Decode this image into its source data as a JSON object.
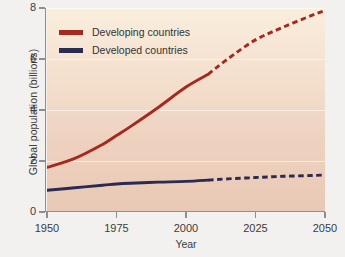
{
  "chart_data": {
    "type": "line",
    "title": "",
    "xlabel": "Year",
    "ylabel": "Global population (billions)",
    "xlim": [
      1950,
      2050
    ],
    "ylim": [
      0,
      8
    ],
    "xticks": [
      "1950",
      "1975",
      "2000",
      "2025",
      "2050"
    ],
    "yticks": [
      "0",
      "2",
      "4",
      "6",
      "8"
    ],
    "grid": true,
    "legend_position": "top-left",
    "projection_start_year": 2008,
    "series": [
      {
        "name": "Developing countries",
        "color": "#a5291e",
        "x": [
          1950,
          1960,
          1970,
          1975,
          1980,
          1990,
          2000,
          2008,
          2015,
          2025,
          2035,
          2045,
          2050
        ],
        "values": [
          1.75,
          2.1,
          2.65,
          3.0,
          3.35,
          4.1,
          4.9,
          5.4,
          6.0,
          6.75,
          7.25,
          7.7,
          7.9
        ],
        "solid_until": 2008,
        "dashed_after": 2008
      },
      {
        "name": "Developed countries",
        "color": "#2a2a52",
        "x": [
          1950,
          1960,
          1970,
          1975,
          1980,
          1990,
          2000,
          2008,
          2015,
          2025,
          2035,
          2045,
          2050
        ],
        "values": [
          0.85,
          0.95,
          1.05,
          1.1,
          1.13,
          1.17,
          1.2,
          1.25,
          1.3,
          1.35,
          1.4,
          1.43,
          1.45
        ],
        "solid_until": 2008,
        "dashed_after": 2008
      }
    ]
  },
  "legend": {
    "items": [
      {
        "label": "Developing countries",
        "color": "#a5291e"
      },
      {
        "label": "Developed countries",
        "color": "#2a2a52"
      }
    ]
  },
  "axes": {
    "x_title": "Year",
    "y_title": "Global population (billions)",
    "x_tick_labels": [
      "1950",
      "1975",
      "2000",
      "2025",
      "2050"
    ],
    "y_tick_labels": [
      "0",
      "2",
      "4",
      "6",
      "8"
    ]
  },
  "colors": {
    "page_background": "#f2f1ef",
    "plot_background_top": "#faeedd",
    "plot_background_bottom": "#e9c9b6",
    "developing": "#a5291e",
    "developed": "#2a2a52",
    "axis": "#8e8e8e",
    "text": "#3c3c3c"
  }
}
